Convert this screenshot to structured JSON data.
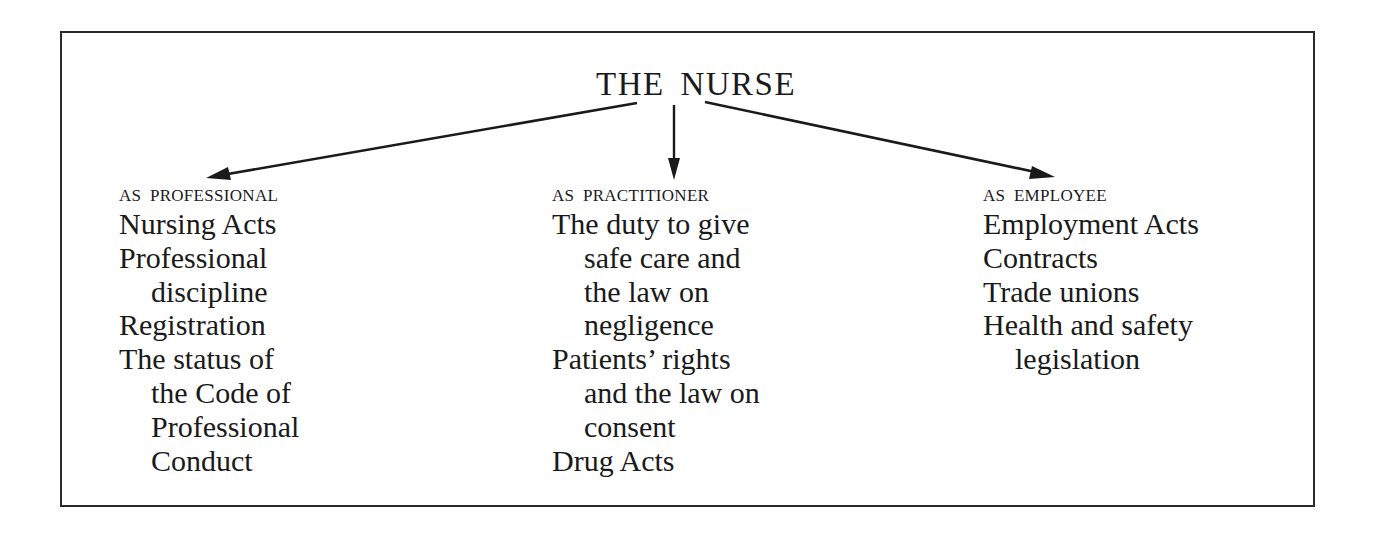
{
  "diagram": {
    "title": "THE NURSE",
    "columns": [
      {
        "heading": "AS PROFESSIONAL",
        "items": [
          {
            "lines": [
              "Nursing Acts"
            ]
          },
          {
            "lines": [
              "Professional",
              "discipline"
            ]
          },
          {
            "lines": [
              "Registration"
            ]
          },
          {
            "lines": [
              "The status of",
              "the Code of",
              "Professional",
              "Conduct"
            ]
          }
        ]
      },
      {
        "heading": "AS PRACTITIONER",
        "items": [
          {
            "lines": [
              "The duty to give",
              "safe care and",
              "the law on",
              "negligence"
            ]
          },
          {
            "lines": [
              "Patients’ rights",
              "and the law on",
              "consent"
            ]
          },
          {
            "lines": [
              "Drug Acts"
            ]
          }
        ]
      },
      {
        "heading": "AS EMPLOYEE",
        "items": [
          {
            "lines": [
              "Employment Acts"
            ]
          },
          {
            "lines": [
              "Contracts"
            ]
          },
          {
            "lines": [
              "Trade unions"
            ]
          },
          {
            "lines": [
              "Health and safety",
              "legislation"
            ]
          }
        ]
      }
    ],
    "arrows": [
      {
        "from": "THE NURSE",
        "to": "AS PROFESSIONAL",
        "direction": "down-left"
      },
      {
        "from": "THE NURSE",
        "to": "AS PRACTITIONER",
        "direction": "down"
      },
      {
        "from": "THE NURSE",
        "to": "AS EMPLOYEE",
        "direction": "down-right"
      }
    ],
    "colors": {
      "ink": "#1a1a1a",
      "border": "#2a2a2a",
      "background": "#ffffff"
    }
  }
}
